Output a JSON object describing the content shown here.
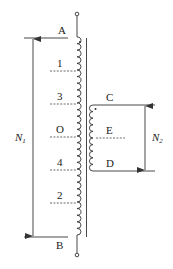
{
  "diagram": {
    "type": "autotransformer-with-secondary",
    "primary": {
      "top_terminal": "A",
      "bottom_terminal": "B",
      "taps": [
        "1",
        "3",
        "O",
        "4",
        "2"
      ],
      "turns_label": "N",
      "turns_sub": "1"
    },
    "secondary": {
      "top_terminal": "C",
      "center_tap": "E",
      "bottom_terminal": "D",
      "turns_label": "N",
      "turns_sub": "2"
    },
    "colors": {
      "line": "#333333",
      "background": "#ffffff"
    }
  }
}
